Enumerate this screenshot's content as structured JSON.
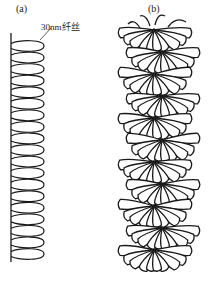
{
  "panels": [
    {
      "label": "(a)",
      "annotation": "30nm纤丝",
      "loop_count": 19
    },
    {
      "label": "(b)"
    }
  ],
  "colors": {
    "stroke": "#1a1a1a",
    "background": "#ffffff"
  }
}
